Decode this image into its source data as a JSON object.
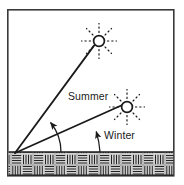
{
  "figure": {
    "background_color": "#ffffff",
    "ink_color": "#1a1a1a",
    "frame": {
      "name": "outer-frame",
      "x": 7,
      "y": 9,
      "width": 167,
      "height": 167,
      "stroke_width": 1.6,
      "stroke_color": "#3a3a3a"
    }
  },
  "labels": {
    "summer": "Summer",
    "winter": "Winter"
  },
  "label_positions": {
    "summer": {
      "x": 69,
      "y": 100
    },
    "winter": {
      "x": 104,
      "y": 139
    }
  },
  "origin": {
    "name": "observer-point",
    "x": 15,
    "y": 153
  },
  "suns": [
    {
      "id": "summer-sun",
      "season": "Summer",
      "cx": 99,
      "cy": 41,
      "radius": 5.4,
      "ray_count": 8,
      "ray_inner": 8,
      "ray_outer": 17,
      "dash": "2.2 2.2"
    },
    {
      "id": "winter-sun",
      "season": "Winter",
      "cx": 127,
      "cy": 107,
      "radius": 5.4,
      "ray_count": 8,
      "ray_inner": 8,
      "ray_outer": 17,
      "dash": "2.2 2.2"
    }
  ],
  "sight_lines": [
    {
      "id": "summer-sight-line",
      "season": "Summer",
      "x1": 15,
      "y1": 153,
      "x2": 94,
      "y2": 45,
      "stroke_width": 1.7
    },
    {
      "id": "winter-sight-line",
      "season": "Winter",
      "x1": 15,
      "y1": 153,
      "x2": 122,
      "y2": 105,
      "stroke_width": 1.7
    }
  ],
  "ground": {
    "name": "ground-hatch-band",
    "x": 8,
    "y": 152,
    "width": 165,
    "height": 23,
    "fill": "#cfcfcf",
    "pattern": "basketweave-hatch",
    "cell": 11,
    "top_rule_y": 152,
    "stroke_width": 1.4
  },
  "angle_arcs": [
    {
      "id": "summer-angle-arc",
      "season": "Summer",
      "path": "M 60 153 A 46 46 0 0 0 49 120",
      "arrow_tip": {
        "x": 49,
        "y": 120
      },
      "arrow_angle": -108,
      "stroke_width": 1.3
    },
    {
      "id": "winter-angle-arc",
      "season": "Winter",
      "path": "M 99 153 A 86 86 0 0 0 95 130",
      "arrow_tip": {
        "x": 95,
        "y": 130
      },
      "arrow_angle": -100,
      "stroke_width": 1.3
    }
  ]
}
